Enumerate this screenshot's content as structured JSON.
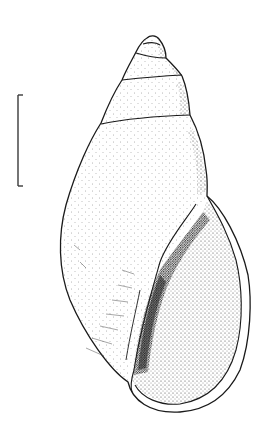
{
  "figure": {
    "view": "apertural view",
    "scale_bar": {
      "label": ""
    },
    "colors": {
      "ink": "#1a1a1a",
      "background": "#ffffff"
    }
  }
}
